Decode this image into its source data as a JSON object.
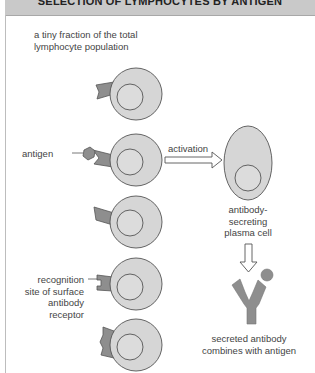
{
  "title": "SELECTION OF LYMPHOCYTES BY ANTIGEN",
  "labels": {
    "population": [
      "a tiny fraction of the total",
      "lymphocyte population"
    ],
    "antigen": "antigen",
    "activation": "activation",
    "plasma_cell": [
      "antibody-",
      "secreting",
      "plasma cell"
    ],
    "recognition_site": [
      "recognition",
      "site of surface",
      "antibody",
      "receptor"
    ],
    "secreted": [
      "secreted antibody",
      "combines with antigen"
    ]
  },
  "colors": {
    "cell_fill": "#d6d6d6",
    "nucleus_fill": "#dcdcdc",
    "outline": "#555555",
    "receptor_fill": "#8e8e8e",
    "title_bg": "#c9c9c9"
  },
  "cells": [
    {
      "id": "lymphocyte-1",
      "cx": 136,
      "cy": 94,
      "r": 26
    },
    {
      "id": "lymphocyte-2-antigen-bound",
      "cx": 136,
      "cy": 160,
      "r": 26
    },
    {
      "id": "lymphocyte-3",
      "cx": 136,
      "cy": 222,
      "r": 26
    },
    {
      "id": "lymphocyte-4",
      "cx": 136,
      "cy": 284,
      "r": 26
    },
    {
      "id": "lymphocyte-5",
      "cx": 136,
      "cy": 345,
      "r": 26
    }
  ],
  "plasma_cell": {
    "cx": 248,
    "cy": 163,
    "rx": 24,
    "ry": 37
  }
}
